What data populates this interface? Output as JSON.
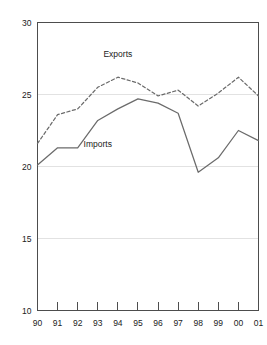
{
  "chart_data": {
    "type": "line",
    "title": "",
    "subtitle": "",
    "xlabel": "",
    "ylabel": "",
    "categories": [
      "90",
      "91",
      "92",
      "93",
      "94",
      "95",
      "96",
      "97",
      "98",
      "99",
      "00",
      "01"
    ],
    "x_tick_labels": [
      "90",
      "91",
      "92",
      "93",
      "94",
      "95",
      "96",
      "97",
      "98",
      "99",
      "00",
      "01"
    ],
    "y_tick_labels": [
      "30",
      "25",
      "20",
      "15",
      "10"
    ],
    "y_ticks": [
      30,
      25,
      20,
      15,
      10
    ],
    "ylim": [
      10,
      30
    ],
    "xlim_labels": [
      "90",
      "01"
    ],
    "grid": "horizontal",
    "gridlines_at": [
      25,
      20,
      15
    ],
    "legend_position": "inline-annotations",
    "series": [
      {
        "name": "Exports",
        "style": "dashed",
        "color": "#6b6b6b",
        "values": [
          21.6,
          23.6,
          24.0,
          25.5,
          26.2,
          25.8,
          24.9,
          25.3,
          24.2,
          25.1,
          26.2,
          24.9
        ]
      },
      {
        "name": "Imports",
        "style": "solid",
        "color": "#6b6b6b",
        "values": [
          20.1,
          21.3,
          21.3,
          23.2,
          24.0,
          24.7,
          24.4,
          23.7,
          19.6,
          20.6,
          22.5,
          21.8
        ]
      }
    ],
    "annotations": [
      {
        "text": "Exports",
        "x_category": "94",
        "y_value": 27.6
      },
      {
        "text": "Imports",
        "x_category": "93",
        "y_value": 21.35
      }
    ]
  },
  "colors": {
    "axis": "#4d4d4d",
    "grid": "#e2e2e2",
    "line": "#6b6b6b",
    "text": "#222222",
    "background": "#ffffff"
  }
}
